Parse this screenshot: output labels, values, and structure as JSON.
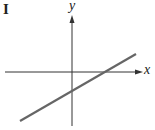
{
  "panel_label": "I",
  "axes": {
    "x_label": "x",
    "y_label": "y"
  },
  "line": {
    "description": "straight line with positive slope, positive x-intercept, negative y-intercept",
    "color": "#666666"
  },
  "colors": {
    "axis": "#333333",
    "line": "#666666",
    "background": "#ffffff"
  }
}
